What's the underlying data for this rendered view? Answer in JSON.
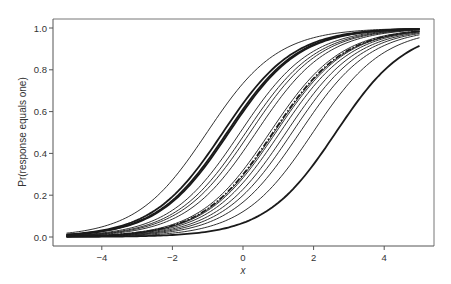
{
  "chart_data": {
    "type": "line",
    "title": "",
    "xlabel": "x",
    "ylabel": "Pr(response equals one)",
    "xlim": [
      -5,
      5
    ],
    "ylim": [
      0,
      1
    ],
    "x_ticks": [
      -4,
      -2,
      0,
      2,
      4
    ],
    "x_tick_labels": [
      "−4",
      "−2",
      "0",
      "2",
      "4"
    ],
    "y_ticks": [
      0.0,
      0.2,
      0.4,
      0.6,
      0.8,
      1.0
    ],
    "y_tick_labels": [
      "0.0",
      "0.2",
      "0.4",
      "0.6",
      "0.8",
      "1.0"
    ],
    "grid": false,
    "legend": null,
    "function": "logistic: p = 1 / (1 + exp(-(x - center)))",
    "series": [
      {
        "name": "curve-1",
        "center": -1.02,
        "style": "thin"
      },
      {
        "name": "curve-2",
        "center": -0.57,
        "style": "thick"
      },
      {
        "name": "curve-3",
        "center": -0.45,
        "style": "thick"
      },
      {
        "name": "curve-4",
        "center": -0.4,
        "style": "thick"
      },
      {
        "name": "curve-5",
        "center": -0.08,
        "style": "thin"
      },
      {
        "name": "curve-6",
        "center": 0.08,
        "style": "thin"
      },
      {
        "name": "curve-7",
        "center": 0.2,
        "style": "thin"
      },
      {
        "name": "curve-8",
        "center": 0.37,
        "style": "thin"
      },
      {
        "name": "curve-9",
        "center": 0.76,
        "style": "thin"
      },
      {
        "name": "curve-10",
        "center": 0.88,
        "style": "thin"
      },
      {
        "name": "curve-11",
        "center": 0.93,
        "style": "thin"
      },
      {
        "name": "curve-12",
        "center": 1.05,
        "style": "thin"
      },
      {
        "name": "curve-13",
        "center": 1.22,
        "style": "thin"
      },
      {
        "name": "curve-14",
        "center": 1.39,
        "style": "thin"
      },
      {
        "name": "curve-15",
        "center": 1.61,
        "style": "thin"
      },
      {
        "name": "curve-16",
        "center": 1.98,
        "style": "thin"
      },
      {
        "name": "curve-17",
        "center": 2.63,
        "style": "thick"
      },
      {
        "name": "average",
        "center": 0.85,
        "style": "dash-dot"
      }
    ],
    "x_range_plotted": [
      -5,
      5
    ],
    "colors": {
      "line": "#1a1a1a",
      "axis": "#555555",
      "background": "#ffffff"
    }
  }
}
